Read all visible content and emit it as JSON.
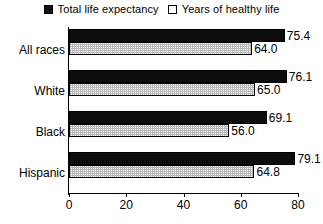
{
  "chart_data": {
    "type": "bar",
    "orientation": "horizontal",
    "title": "",
    "xlabel": "",
    "ylabel": "",
    "xlim": [
      0,
      80
    ],
    "xticks": [
      0,
      20,
      40,
      60,
      80
    ],
    "grid": false,
    "legend_position": "top-center",
    "categories": [
      "All races",
      "White",
      "Black",
      "Hispanic"
    ],
    "series": [
      {
        "name": "Total life expectancy",
        "swatch": "solid-black",
        "color": "#0d0d0d",
        "values": [
          75.4,
          76.1,
          69.1,
          79.1
        ],
        "value_labels": [
          "75.4",
          "76.1",
          "69.1",
          "79.1"
        ]
      },
      {
        "name": "Years of healthy life",
        "swatch": "white-stippled",
        "color": "#e8e8e8",
        "values": [
          64.0,
          65.0,
          56.0,
          64.8
        ],
        "value_labels": [
          "64.0",
          "65.0",
          "56.0",
          "64.8"
        ]
      }
    ]
  },
  "legend": {
    "entries": [
      {
        "label": "Total life expectancy"
      },
      {
        "label": "Years of healthy life"
      }
    ]
  },
  "axis": {
    "x_tick_labels": [
      "0",
      "20",
      "40",
      "60",
      "80"
    ]
  }
}
